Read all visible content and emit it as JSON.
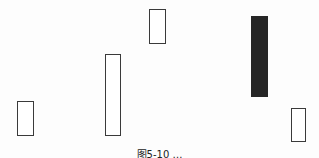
{
  "diagram": {
    "type": "candlestick-bodies",
    "candles": [
      {
        "id": "c1",
        "kind": "bullish",
        "fill": "#ffffff",
        "x": 17,
        "y": 101,
        "w": 17,
        "h": 35
      },
      {
        "id": "c2",
        "kind": "bullish",
        "fill": "#ffffff",
        "x": 105,
        "y": 54,
        "w": 16,
        "h": 82
      },
      {
        "id": "c3",
        "kind": "bullish",
        "fill": "#ffffff",
        "x": 149,
        "y": 9,
        "w": 17,
        "h": 35
      },
      {
        "id": "c4",
        "kind": "bearish",
        "fill": "#262626",
        "x": 251,
        "y": 16,
        "w": 17,
        "h": 81
      },
      {
        "id": "c5",
        "kind": "bullish",
        "fill": "#ffffff",
        "x": 291,
        "y": 108,
        "w": 15,
        "h": 34
      }
    ],
    "caption": "图5-10 …"
  }
}
